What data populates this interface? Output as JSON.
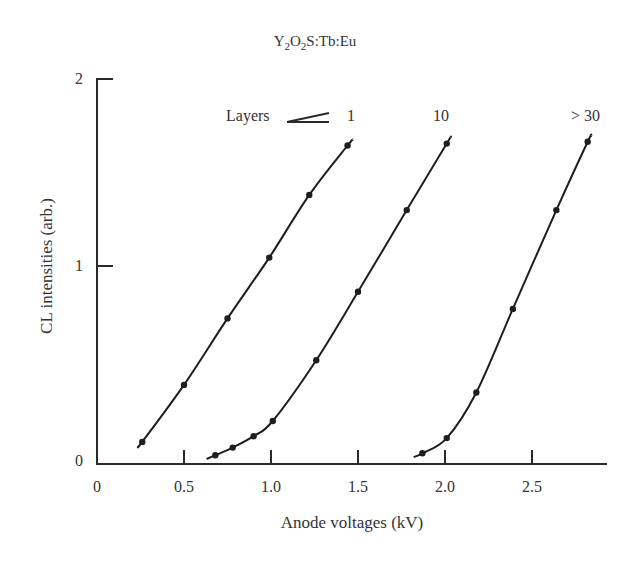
{
  "chart_data": {
    "type": "line",
    "title": "Y2O2S:Tb:Eu",
    "title_parts": {
      "y": "Y",
      "sub1": "2",
      "o": "O",
      "sub2": "2",
      "rest": "S:Tb:Eu"
    },
    "xlabel": "Anode voltages (kV)",
    "ylabel": "CL intensities (arb.)",
    "xlim": [
      0,
      3.0
    ],
    "ylim": [
      0,
      2
    ],
    "xticks": [
      0,
      0.5,
      1.0,
      1.5,
      2.0,
      2.5
    ],
    "xtick_labels": [
      "0",
      "0.5",
      "1.0",
      "1.5",
      "2.0",
      "2.5"
    ],
    "yticks": [
      0,
      1,
      2
    ],
    "ytick_labels": [
      "0",
      "1",
      "2"
    ],
    "grid": false,
    "legend": "inline labels above curves",
    "annotation": "Layers",
    "series": [
      {
        "name": "1",
        "label": "1",
        "x": [
          0.26,
          0.5,
          0.75,
          0.99,
          1.22,
          1.44
        ],
        "y": [
          0.09,
          0.39,
          0.74,
          1.06,
          1.39,
          1.65
        ],
        "curve_x": [
          0.24,
          1.47
        ],
        "curve_y": [
          0.07,
          1.68
        ]
      },
      {
        "name": "10",
        "label": "10",
        "x": [
          0.68,
          0.78,
          0.9,
          1.01,
          1.26,
          1.5,
          1.78,
          2.01
        ],
        "y": [
          0.02,
          0.06,
          0.12,
          0.2,
          0.52,
          0.88,
          1.31,
          1.66
        ]
      },
      {
        "name": ">30",
        "label": "> 30",
        "x": [
          1.87,
          2.01,
          2.18,
          2.39,
          2.64,
          2.82
        ],
        "y": [
          0.03,
          0.11,
          0.35,
          0.79,
          1.31,
          1.67
        ]
      }
    ]
  },
  "labels": {
    "layers": "Layers",
    "s1": "1",
    "s2": "10",
    "s3": "> 30"
  }
}
